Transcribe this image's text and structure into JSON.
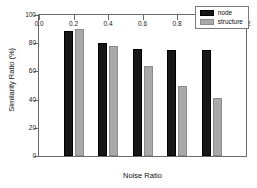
{
  "chart_data": {
    "type": "bar",
    "title": "",
    "xlabel": "Noise Ratio",
    "ylabel": "Similarity Ratio (%)",
    "xlim": [
      0.0,
      1.2
    ],
    "ylim": [
      0,
      100
    ],
    "xticks": [
      "0.0",
      "0.2",
      "0.4",
      "0.6",
      "0.8",
      "1.0",
      "1.2"
    ],
    "xtick_values": [
      0.0,
      0.2,
      0.4,
      0.6,
      0.8,
      1.0,
      1.2
    ],
    "yticks": [
      "0",
      "20",
      "40",
      "60",
      "80",
      "100"
    ],
    "ytick_values": [
      0,
      20,
      40,
      60,
      80,
      100
    ],
    "grid": false,
    "legend_position": "top-right",
    "categories": [
      0.2,
      0.4,
      0.6,
      0.8,
      1.0
    ],
    "series": [
      {
        "name": "node",
        "color": "#171717",
        "values": [
          89,
          80,
          76,
          75,
          75
        ]
      },
      {
        "name": "structure",
        "color": "#a9a9a9",
        "values": [
          90,
          78,
          64,
          50,
          41
        ]
      }
    ]
  },
  "legend": {
    "items": [
      {
        "label": "node",
        "swatch": "node-swatch"
      },
      {
        "label": "structure",
        "swatch": "structure-swatch"
      }
    ]
  },
  "colors": {
    "node": "#171717",
    "structure": "#a9a9a9",
    "axis": "#6b6b6b",
    "text": "#111111",
    "background": "#ffffff"
  }
}
